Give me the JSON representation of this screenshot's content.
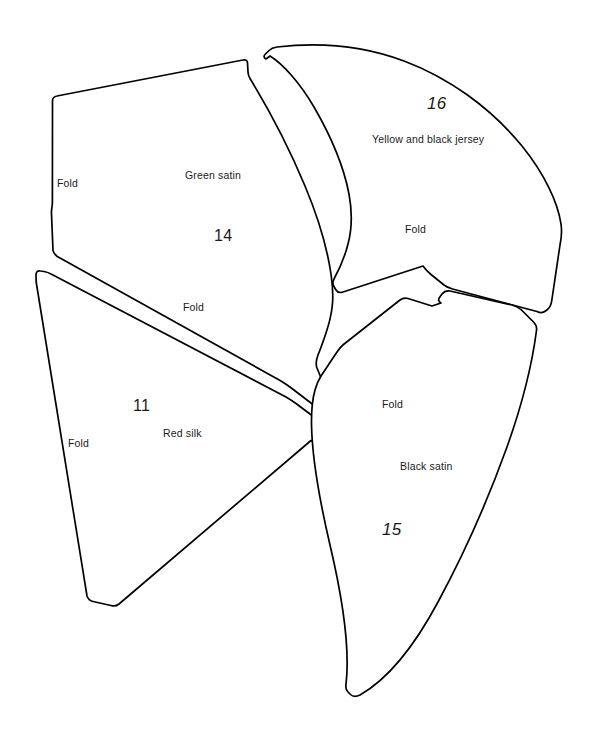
{
  "document": {
    "title": "Garment pattern pieces layout",
    "background_color": "#ffffff",
    "line_color": "#000000",
    "text_color": "#1a1a1a"
  },
  "pieces": [
    {
      "number": "14",
      "fabric": "Green satin",
      "folds": [
        "Fold",
        "Fold"
      ]
    },
    {
      "number": "16",
      "fabric": "Yellow and black jersey",
      "folds": [
        "Fold"
      ]
    },
    {
      "number": "11",
      "fabric": "Red silk",
      "folds": [
        "Fold",
        "Fold"
      ]
    },
    {
      "number": "15",
      "fabric": "Black satin",
      "folds": [
        "Fold"
      ]
    }
  ],
  "labels": {
    "green_satin": "Green satin",
    "num_14": "14",
    "fold_14_left": "Fold",
    "fold_14_bottom": "Fold",
    "yellow_black_jersey": "Yellow and black jersey",
    "num_16": "16",
    "fold_16": "Fold",
    "red_silk": "Red silk",
    "num_11": "11",
    "fold_11_top": "Fold",
    "fold_11_left": "Fold",
    "black_satin": "Black satin",
    "num_15": "15",
    "fold_15": "Fold"
  }
}
